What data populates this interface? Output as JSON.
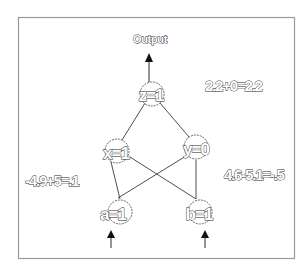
{
  "diagram": {
    "type": "neural-network",
    "output_label": "Output",
    "nodes": {
      "z": {
        "label": "z=1",
        "cx": 152,
        "cy": 94
      },
      "x": {
        "label": "x=1",
        "cx": 117,
        "cy": 151
      },
      "y": {
        "label": "y=0",
        "cx": 196,
        "cy": 147
      },
      "a": {
        "label": "a=1",
        "cx": 120,
        "cy": 212
      },
      "b": {
        "label": "b=1",
        "cx": 200,
        "cy": 212
      }
    },
    "edges": [
      {
        "from": "x",
        "to": "z"
      },
      {
        "from": "y",
        "to": "z"
      },
      {
        "from": "a",
        "to": "x"
      },
      {
        "from": "a",
        "to": "y"
      },
      {
        "from": "b",
        "to": "x"
      },
      {
        "from": "b",
        "to": "y"
      }
    ],
    "equations": {
      "z": "2.2+0=2.2",
      "x": "-4.9+5=.1",
      "y": "4.6-5.1=-.5"
    },
    "colors": {
      "frame": "#9a9a9a",
      "line": "#3a3a3a",
      "node_stroke": "#555555",
      "text_fill": "#ffffff",
      "text_stroke": "#2a2a2a"
    }
  }
}
